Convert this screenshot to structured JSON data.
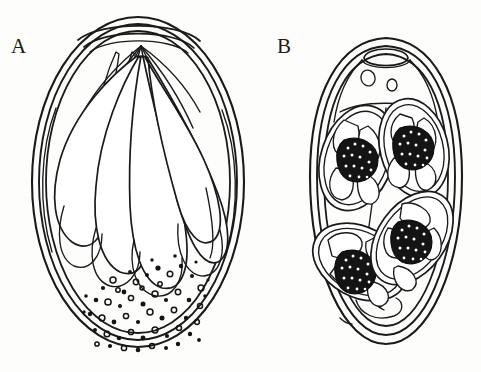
{
  "figure": {
    "background_color": "#fdfdfc",
    "ink_color": "#1a1a1a",
    "width": 481,
    "height": 372,
    "panels": [
      {
        "id": "A",
        "label": "A",
        "label_x": 11,
        "label_y": 36,
        "caption": "Unsporulated / developing egg with elongate club-shaped internal bodies and basal granular mass",
        "shell_layer_count": 3,
        "internal_body_count": 7,
        "granular_mass": {
          "present": true,
          "description": "dense basal field of small dots and rings",
          "dot_count": 96
        }
      },
      {
        "id": "B",
        "label": "B",
        "label_x": 277,
        "label_y": 36,
        "caption": "Sporulated oocyst with micropylar cap, polar granules and four sporocysts each bearing a dark residual body",
        "shell_layer_count": 3,
        "micropyle_cap": true,
        "polar_granule_count": 2,
        "sporocyst_count": 4,
        "residual_body_count": 4,
        "sporozoites_per_sporocyst": 2
      }
    ]
  },
  "colors": {
    "ink": "#1a1a1a",
    "paper": "#fdfdfc",
    "residual_body": "#141414",
    "granule": "#141414"
  }
}
